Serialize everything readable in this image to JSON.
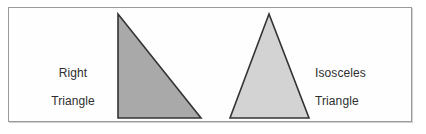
{
  "figure": {
    "background_color": "#ffffff",
    "frame": {
      "border_color": "#9a9a9a",
      "fill_color": "#fefefe"
    }
  },
  "labels": {
    "right_triangle": {
      "line1": "Right",
      "line2": "Triangle",
      "color": "#2e2e2e"
    },
    "isosceles_triangle": {
      "line1": "Isosceles",
      "line2": "Triangle",
      "color": "#2e2e2e"
    }
  },
  "shapes": [
    {
      "name": "right-triangle",
      "points": "109,6 109,110 192,110",
      "fill": "#a9a9a9",
      "stroke": "#333333",
      "stroke_width": 1.6
    },
    {
      "name": "isosceles-triangle",
      "points": "260,6 221,110 300,110",
      "fill": "#d3d3d3",
      "stroke": "#333333",
      "stroke_width": 1.6
    }
  ]
}
